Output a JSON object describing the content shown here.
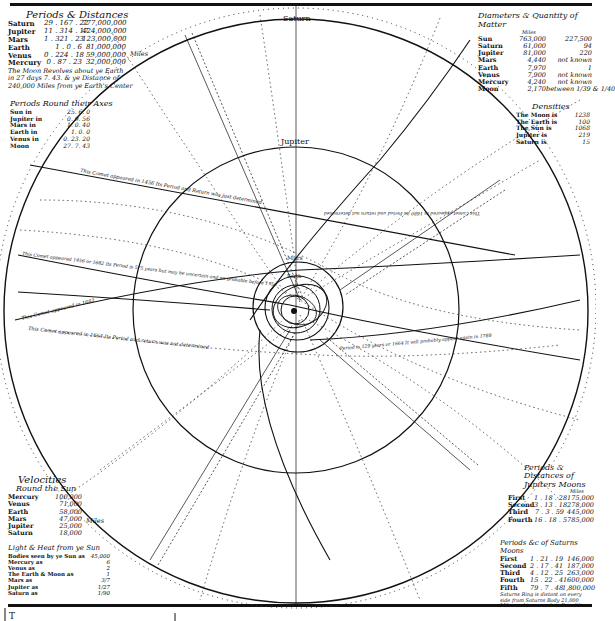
{
  "diagram": {
    "kind": "Solar system with comet orbits (historical engraving)",
    "colors": {
      "ink": "#111111",
      "paper": "#ffffff",
      "dotted": "#444444"
    },
    "orbit_labels": [
      "Saturn",
      "Jupiter",
      "Mars",
      "Earth"
    ],
    "comet_captions": [
      "This Comet appeared in 1456 Its Period and Return was just determined",
      "This Comet appeared 1456 or 1682 Its Period is 575 years but may be uncertain and no probable before 1758",
      "This Comet appeared in 1682",
      "This Comet appeared in 1664 Its Period and return was not determined",
      "Period is 129 years or 1664 It will probably appear again in 1789",
      "This Comet appeared in 1680 its Period and return not determined"
    ],
    "bottom_text": "T"
  },
  "periods_distances": {
    "title": "Periods & Distances",
    "unit_label": "Miles",
    "rows": [
      {
        "planet": "Saturn",
        "period": "29 . 167 . 22",
        "distance": "777,000,000"
      },
      {
        "planet": "Jupiter",
        "period": "11 . 314 . 17",
        "distance": "424,000,000"
      },
      {
        "planet": "Mars",
        "period": "1 . 321 . 23",
        "distance": "123,000,000"
      },
      {
        "planet": "Earth",
        "period": "1 . 0 . 6",
        "distance": "81,000,000"
      },
      {
        "planet": "Venus",
        "period": "0 . 224 . 18",
        "distance": "59,000,000"
      },
      {
        "planet": "Mercury",
        "period": "0 . 87 . 23",
        "distance": "32,000,000"
      }
    ],
    "moon_note": [
      "The Moon Revolves about ye Earth",
      "in 27 days 7. 43. & ye Distance of",
      "240,000 Miles from ye Earth's Center"
    ]
  },
  "periods_axis": {
    "title": "Periods Round their Axes",
    "rows": [
      {
        "body": "Sun in",
        "value": "25. 6. 0"
      },
      {
        "body": "Jupiter in",
        "value": "0. 9. 56"
      },
      {
        "body": "Mars in",
        "value": "1. 0. 40"
      },
      {
        "body": "Earth in",
        "value": "1. 0. 0"
      },
      {
        "body": "Venus in",
        "value": "0. 23. 20"
      },
      {
        "body": "Moon",
        "value": "27. 7. 43"
      }
    ]
  },
  "diameters": {
    "title": "Diameters & Quantity of Matter",
    "unit_label": "Miles",
    "rows": [
      {
        "body": "Sun",
        "diameter": "763,000",
        "matter": "227,500"
      },
      {
        "body": "Saturn",
        "diameter": "61,000",
        "matter": "94"
      },
      {
        "body": "Jupiter",
        "diameter": "81,000",
        "matter": "220"
      },
      {
        "body": "Mars",
        "diameter": "4,440",
        "matter": "not known"
      },
      {
        "body": "Earth",
        "diameter": "7,970",
        "matter": "1"
      },
      {
        "body": "Venus",
        "diameter": "7,900",
        "matter": "not known"
      },
      {
        "body": "Mercury",
        "diameter": "4,240",
        "matter": "not known"
      },
      {
        "body": "Moon",
        "diameter": "2,170",
        "matter": "between 1/39 & 1/40"
      }
    ]
  },
  "densities": {
    "title": "Densities",
    "rows": [
      {
        "body": "The Moon is",
        "value": "1238"
      },
      {
        "body": "The Earth is",
        "value": "100"
      },
      {
        "body": "The Sun is",
        "value": "1068"
      },
      {
        "body": "Jupiter is",
        "value": "219"
      },
      {
        "body": "Saturn is",
        "value": "15"
      }
    ]
  },
  "velocities": {
    "title": "Velocities",
    "subtitle": "Round the Sun",
    "unit_label": "Miles",
    "rows": [
      {
        "planet": "Mercury",
        "value": "100,000"
      },
      {
        "planet": "Venus",
        "value": "71,000"
      },
      {
        "planet": "Earth",
        "value": "58,000"
      },
      {
        "planet": "Mars",
        "value": "47,000"
      },
      {
        "planet": "Jupiter",
        "value": "25,000"
      },
      {
        "planet": "Saturn",
        "value": "18,000"
      }
    ]
  },
  "light_heat": {
    "title": "Light & Heat from ye Sun",
    "rows": [
      {
        "body": "Bodies seen by ye Sun as",
        "value": "45,000"
      },
      {
        "body": "Mercury as",
        "value": "6"
      },
      {
        "body": "Venus as",
        "value": "2"
      },
      {
        "body": "The Earth & Moon as",
        "value": "1"
      },
      {
        "body": "Mars as",
        "value": "3/7"
      },
      {
        "body": "Jupiter as",
        "value": "1/27"
      },
      {
        "body": "Saturn as",
        "value": "1/90"
      }
    ]
  },
  "jupiter_moons": {
    "title": "Periods & Distances of Jupiters Moons",
    "unit_label": "Miles",
    "rows": [
      {
        "moon": "First",
        "period": "1 . 18 . 28",
        "distance": "175,000"
      },
      {
        "moon": "Second",
        "period": "3 . 13 . 18",
        "distance": "278,000"
      },
      {
        "moon": "Third",
        "period": "7 . 3 . 59",
        "distance": "445,000"
      },
      {
        "moon": "Fourth",
        "period": "16 . 18 . 5",
        "distance": "785,000"
      }
    ]
  },
  "saturn_moons": {
    "title": "Periods &c of Saturns Moons",
    "unit_label": "Miles",
    "rows": [
      {
        "moon": "First",
        "period": "1 . 21 . 19",
        "distance": "146,000"
      },
      {
        "moon": "Second",
        "period": "2 . 17 . 41",
        "distance": "187,000"
      },
      {
        "moon": "Third",
        "period": "4 . 12 . 25",
        "distance": "263,000"
      },
      {
        "moon": "Fourth",
        "period": "15 . 22 . 41",
        "distance": "600,000"
      },
      {
        "moon": "Fifth",
        "period": "79 . 7 . 48",
        "distance": "1,800,000"
      }
    ],
    "ring_note": [
      "Saturns Ring is distant on every",
      "side from Saturns Body 21,000",
      "Miles and is as much in Breadth"
    ]
  }
}
